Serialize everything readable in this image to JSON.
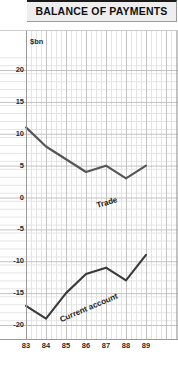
{
  "header": {
    "title": "BALANCE OF PAYMENTS"
  },
  "chart_data": {
    "type": "line",
    "title": "BALANCE OF PAYMENTS",
    "unit_label": "$bn",
    "xlabel": "",
    "ylabel": "$bn",
    "x": [
      "83",
      "84",
      "85",
      "86",
      "87",
      "88",
      "89"
    ],
    "xticklabels": [
      "83",
      "84",
      "85",
      "86",
      "87",
      "88",
      "89"
    ],
    "yticklabels": [
      "20",
      "15",
      "10",
      "5",
      "0",
      "-5",
      "-10",
      "-15",
      "-20"
    ],
    "yticks": [
      20,
      15,
      10,
      5,
      0,
      -5,
      -10,
      -15,
      -20
    ],
    "ylim": [
      -20,
      22
    ],
    "xlim": [
      83,
      89.6
    ],
    "grid": true,
    "grid_minor": true,
    "legend": "inline-annotations",
    "series": [
      {
        "name": "Trade",
        "label": "Trade",
        "color": "#555555",
        "values": [
          11,
          8,
          6,
          4,
          5,
          3,
          5
        ]
      },
      {
        "name": "Current account",
        "label": "Current account",
        "color": "#3a3a3a",
        "values": [
          -17,
          -19,
          -15,
          -12,
          -11,
          -13,
          -9
        ]
      }
    ],
    "annotations": [
      {
        "text": "Trade",
        "x": 86.6,
        "y": 6.5,
        "rotation": -17
      },
      {
        "text": "Current account",
        "x": 84.8,
        "y": -12.5,
        "rotation": -23
      }
    ]
  },
  "colors": {
    "panel_background": "#eeeeee",
    "plot_background": "#ffffff",
    "grid_minor": "#e4e4e4",
    "grid_major": "#c2c2c2",
    "axis": "#9a9a9a",
    "text": "#2a2a2a",
    "trade_line": "#555555",
    "current_account_line": "#3a3a3a"
  }
}
